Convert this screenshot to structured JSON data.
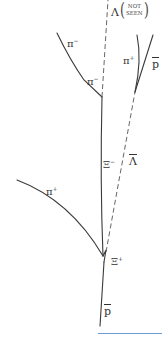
{
  "diagram": {
    "type": "bubble-chamber-event-sketch",
    "labels": {
      "lambda_symbol": "Λ",
      "not_seen_line1": "NOT",
      "not_seen_line2": "SEEN",
      "pi_minus_upper": "π",
      "pi_minus_upper_charge": "−",
      "pi_minus_lower": "π",
      "pi_minus_lower_charge": "−",
      "pi_plus_right": "π",
      "pi_plus_right_charge": "+",
      "pbar_right": "p",
      "xi_minus": "Ξ",
      "xi_minus_charge": "−",
      "lambda_bar": "Λ",
      "pi_plus_left": "π",
      "pi_plus_left_charge": "+",
      "xi_plus": "Ξ",
      "xi_plus_charge": "+",
      "pbar_incoming": "p"
    },
    "tracks": [
      {
        "name": "incoming-antiproton",
        "style": "solid"
      },
      {
        "name": "xi-minus",
        "style": "solid"
      },
      {
        "name": "pi-plus-left",
        "style": "solid"
      },
      {
        "name": "lambda-not-seen",
        "style": "dashed"
      },
      {
        "name": "pi-minus",
        "style": "solid"
      },
      {
        "name": "antilambda",
        "style": "dashed"
      },
      {
        "name": "pi-plus-right",
        "style": "solid"
      },
      {
        "name": "antiproton-right",
        "style": "solid"
      }
    ],
    "colors": {
      "track": "#3a3a3a",
      "bottom_rule": "#6a9bd8"
    }
  }
}
